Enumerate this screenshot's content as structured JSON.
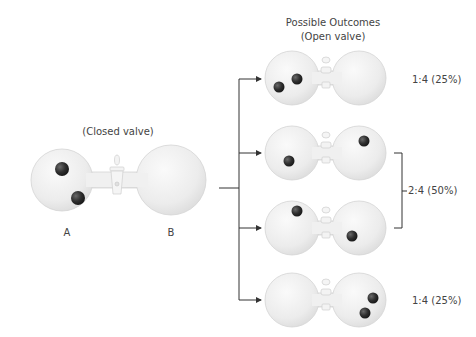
{
  "closed": {
    "title": "(Closed valve)",
    "label_a": "A",
    "label_b": "B"
  },
  "outcomes": {
    "title": "Possible Outcomes",
    "subtitle": "(Open valve)",
    "rows": [
      {
        "id": "both-in-a",
        "left_particles": 2,
        "right_particles": 0
      },
      {
        "id": "one-each-1",
        "left_particles": 1,
        "right_particles": 1
      },
      {
        "id": "one-each-2",
        "left_particles": 1,
        "right_particles": 1
      },
      {
        "id": "both-in-b",
        "left_particles": 0,
        "right_particles": 2
      }
    ],
    "labels": {
      "top": "1:4 (25%)",
      "middle": "2:4 (50%)",
      "bottom": "1:4 (25%)"
    }
  },
  "colors": {
    "glass": "#efefef",
    "glass_edge": "#d6d6d6",
    "particle": "#3a3a3a",
    "line": "#333333"
  }
}
